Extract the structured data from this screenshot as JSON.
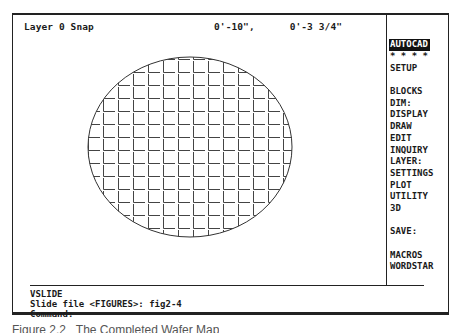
{
  "status_bar": {
    "layer_snap": "Layer 0 Snap",
    "coordinates": "0'-10\",      0'-3 3/4\""
  },
  "screen_menu": {
    "items": [
      {
        "label": "AUTOCAD",
        "highlighted": true
      },
      {
        "label": "* * * *"
      },
      {
        "label": "SETUP"
      },
      {
        "label": ""
      },
      {
        "label": "BLOCKS"
      },
      {
        "label": "DIM:"
      },
      {
        "label": "DISPLAY"
      },
      {
        "label": "DRAW"
      },
      {
        "label": "EDIT"
      },
      {
        "label": "INQUIRY"
      },
      {
        "label": "LAYER:"
      },
      {
        "label": "SETTINGS"
      },
      {
        "label": "PLOT"
      },
      {
        "label": "UTILITY"
      },
      {
        "label": "3D"
      },
      {
        "label": ""
      },
      {
        "label": "SAVE:"
      },
      {
        "label": ""
      },
      {
        "label": "MACROS"
      },
      {
        "label": "WORDSTAR"
      }
    ]
  },
  "command_area": {
    "lines": [
      "VSLIDE",
      "Slide file <FIGURES>: fig2-4",
      "Command:"
    ]
  },
  "drawing": {
    "shape": "ellipse-with-grid-hatch",
    "ellipse": {
      "cx": 177,
      "cy": 132,
      "rx": 102,
      "ry": 90
    },
    "grid": {
      "cell_w": 15,
      "cell_h": 13
    },
    "stroke_color": "#333333"
  },
  "caption": {
    "text": "Figure 2.2   The Completed Wafer Map (partially visible)"
  }
}
